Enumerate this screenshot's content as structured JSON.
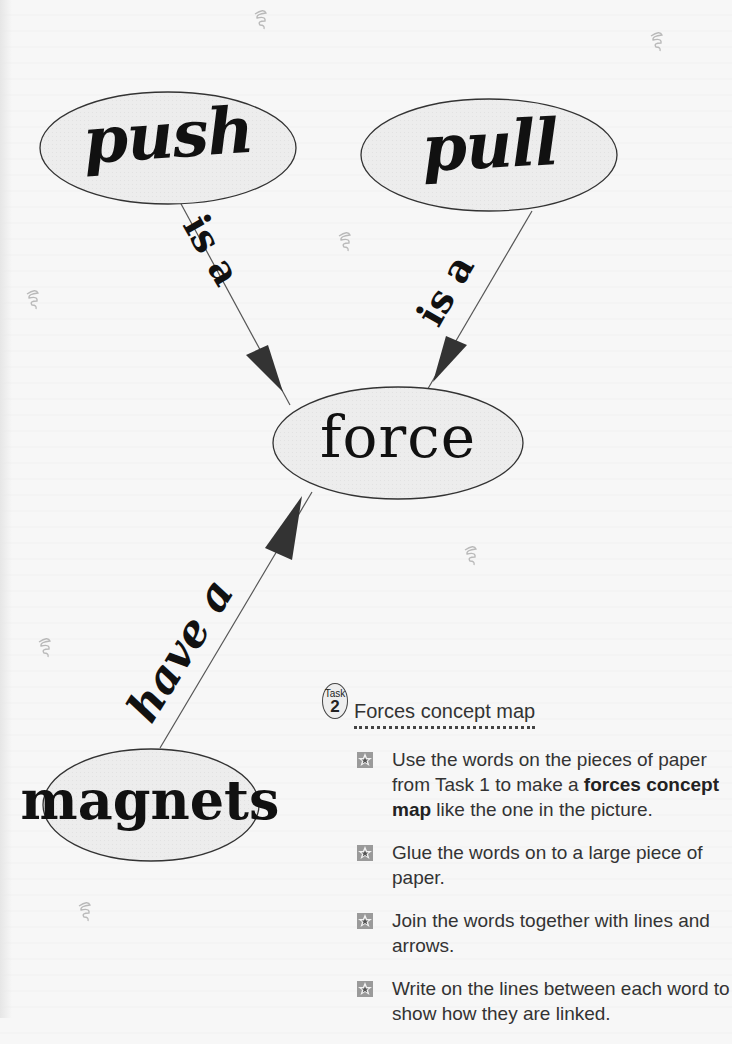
{
  "concept_map": {
    "nodes": {
      "push": "push",
      "pull": "pull",
      "force": "force",
      "magnets": "magnets"
    },
    "links": [
      {
        "from": "push",
        "to": "force",
        "label": "is a"
      },
      {
        "from": "pull",
        "to": "force",
        "label": "is a"
      },
      {
        "from": "magnets",
        "to": "force",
        "label": "have a"
      }
    ],
    "node_fill": "#ececec",
    "node_stroke": "#333333",
    "arrow_color": "#333333",
    "decoration_icon": "spring-swirl-icon"
  },
  "task": {
    "badge_word": "Task",
    "badge_number": "2",
    "title": "Forces concept map",
    "bullet_icon": "star-bullet-icon",
    "items": [
      {
        "before": "Use the words on the pieces of paper from Task 1 to make a ",
        "bold1": "forces concept",
        "mid": " ",
        "bold2": "map",
        "after": " like the one in the picture."
      },
      {
        "text": "Glue the words on to a large piece of paper."
      },
      {
        "text": "Join the words together with lines and arrows."
      },
      {
        "text": "Write on the lines between each word to show how they are linked."
      }
    ]
  }
}
